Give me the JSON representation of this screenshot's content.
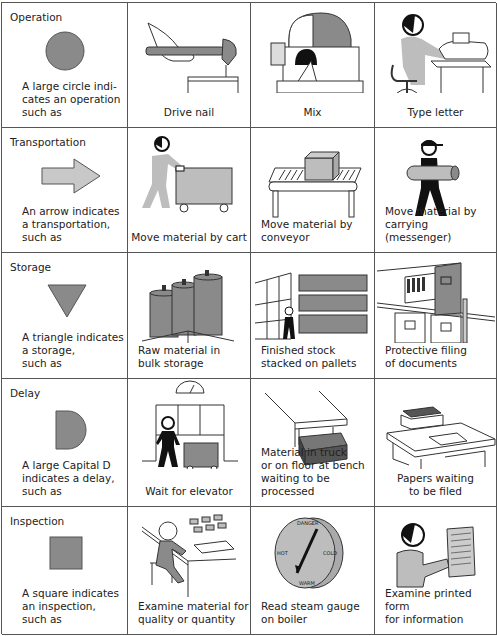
{
  "colors": {
    "symbol_fill": "#8a8a8a",
    "light_fill": "#bdbdbd",
    "line": "#555555",
    "ink": "#111111"
  },
  "rows": [
    {
      "category": {
        "title": "Operation",
        "description": "A large circle indi-\ncates an operation\nsuch as",
        "symbol": "circle"
      },
      "examples": [
        {
          "caption": "Drive nail",
          "icon": "hammer-nail-icon"
        },
        {
          "caption": "Mix",
          "icon": "mixer-machine-icon"
        },
        {
          "caption": "Type letter",
          "icon": "typist-icon"
        }
      ]
    },
    {
      "category": {
        "title": "Transportation",
        "description": "An arrow indicates\na transportation,\nsuch as",
        "symbol": "arrow"
      },
      "examples": [
        {
          "caption": "Move material by cart",
          "icon": "cart-pusher-icon"
        },
        {
          "caption": "Move material by\nconveyor",
          "icon": "conveyor-icon"
        },
        {
          "caption": "Move material by\ncarrying (messenger)",
          "icon": "messenger-icon"
        }
      ]
    },
    {
      "category": {
        "title": "Storage",
        "description": "A triangle indicates\na storage,\nsuch as",
        "symbol": "triangle"
      },
      "examples": [
        {
          "caption": "Raw material in\nbulk storage",
          "icon": "silos-icon"
        },
        {
          "caption": "Finished stock\nstacked on pallets",
          "icon": "pallets-icon"
        },
        {
          "caption": "Protective filing\nof documents",
          "icon": "filing-cabinet-icon"
        }
      ]
    },
    {
      "category": {
        "title": "Delay",
        "description": "A large Capital D\nindicates a delay,\nsuch as",
        "symbol": "d-shape"
      },
      "examples": [
        {
          "caption": "Wait for elevator",
          "icon": "elevator-icon"
        },
        {
          "caption": "Material in truck\nor on floor at bench\nwaiting to be processed",
          "icon": "bench-material-icon"
        },
        {
          "caption": "Papers waiting\nto be filed",
          "icon": "desk-papers-icon"
        }
      ]
    },
    {
      "category": {
        "title": "Inspection",
        "description": "A square indicates\nan inspection,\nsuch as",
        "symbol": "square"
      },
      "examples": [
        {
          "caption": "Examine material for\nquality or quantity",
          "icon": "inspector-bench-icon"
        },
        {
          "caption": "Read steam gauge\non boiler",
          "icon": "steam-gauge-icon"
        },
        {
          "caption": "Examine printed form\nfor information",
          "icon": "form-reader-icon"
        }
      ]
    }
  ],
  "gauge_labels": [
    "DANGER",
    "HOT",
    "COLD",
    "WARM"
  ]
}
